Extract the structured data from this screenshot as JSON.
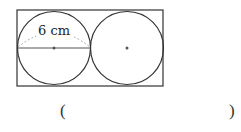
{
  "figure": {
    "label": "6 cm",
    "stroke": "#333333",
    "dash_color": "#aaaaaa",
    "dot_color": "#555555",
    "rectangle": {
      "x": 17,
      "y": 10,
      "width": 146,
      "height": 76
    },
    "circles": [
      {
        "cx": 54,
        "cy": 48,
        "r": 36.5
      },
      {
        "cx": 127,
        "cy": 48,
        "r": 36.5
      }
    ],
    "diameter": {
      "x1": 17.5,
      "y1": 48,
      "x2": 90.5,
      "y2": 48
    }
  },
  "answer": {
    "open_paren": "(",
    "close_paren": ")"
  }
}
